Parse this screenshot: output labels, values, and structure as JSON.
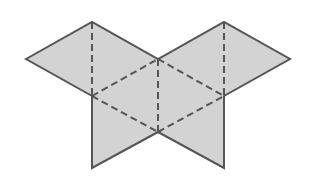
{
  "diagram": {
    "colors": {
      "fill": "#d3d3d3",
      "stroke": "#555555",
      "background": "#ffffff"
    },
    "outline_points": "26,59 92,22 158,59 224,22 290,59 224,96 224,168 158,132 92,168 92,96",
    "fold_lines": [
      {
        "x1": 92,
        "y1": 22,
        "x2": 92,
        "y2": 96
      },
      {
        "x1": 224,
        "y1": 22,
        "x2": 224,
        "y2": 96
      },
      {
        "x1": 158,
        "y1": 59,
        "x2": 158,
        "y2": 132
      },
      {
        "x1": 92,
        "y1": 96,
        "x2": 158,
        "y2": 59
      },
      {
        "x1": 158,
        "y1": 59,
        "x2": 224,
        "y2": 96
      },
      {
        "x1": 92,
        "y1": 96,
        "x2": 158,
        "y2": 132
      },
      {
        "x1": 158,
        "y1": 132,
        "x2": 224,
        "y2": 96
      }
    ]
  }
}
